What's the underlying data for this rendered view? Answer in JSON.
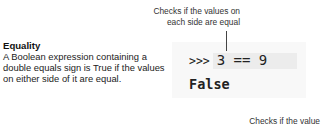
{
  "annotations": {
    "top_line1": "Checks if the values on",
    "top_line2": "each side are equal",
    "bottom_line1": "Checks if the value"
  },
  "definition": {
    "title": "Equality",
    "body_line1": "A Boolean expression containing a",
    "body_line2": "double equals sign is True if the values",
    "body_line3": "on either side of it are equal."
  },
  "code": {
    "prompt": ">>>",
    "expression": "3 == 9",
    "output": "False"
  },
  "colors": {
    "code_bg": "#f8f8f8",
    "highlight_bg": "#ececec",
    "text": "#222222"
  }
}
